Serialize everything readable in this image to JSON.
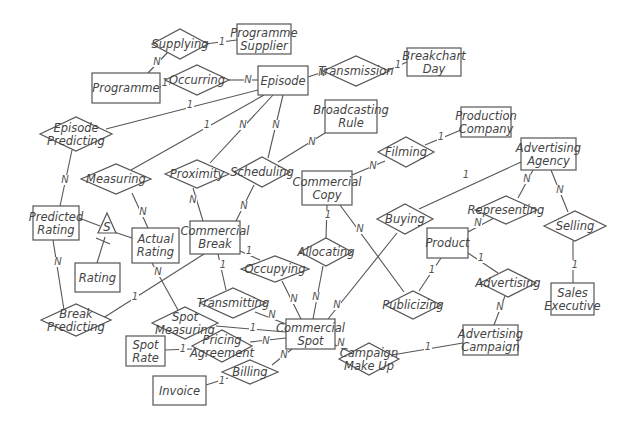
{
  "diagram": {
    "type": "entity-relationship",
    "entities": [
      {
        "id": "programme",
        "label": [
          "Programme"
        ],
        "x": 92,
        "y": 73,
        "w": 68,
        "h": 30
      },
      {
        "id": "programme_supplier",
        "label": [
          "Programme",
          "Supplier"
        ],
        "x": 237,
        "y": 24,
        "w": 54,
        "h": 30
      },
      {
        "id": "episode",
        "label": [
          "Episode"
        ],
        "x": 258,
        "y": 66,
        "w": 50,
        "h": 29
      },
      {
        "id": "breakchart_day",
        "label": [
          "Breakchart",
          "Day"
        ],
        "x": 407,
        "y": 48,
        "w": 54,
        "h": 28
      },
      {
        "id": "broadcasting_rule",
        "label": [
          "Broadcasting",
          "Rule"
        ],
        "x": 325,
        "y": 100,
        "w": 52,
        "h": 33
      },
      {
        "id": "production_company",
        "label": [
          "Production",
          "Company"
        ],
        "x": 461,
        "y": 107,
        "w": 50,
        "h": 30
      },
      {
        "id": "advertising_agency",
        "label": [
          "Advertising",
          "Agency"
        ],
        "x": 521,
        "y": 138,
        "w": 55,
        "h": 32
      },
      {
        "id": "commercial_copy",
        "label": [
          "Commercial",
          "Copy"
        ],
        "x": 302,
        "y": 171,
        "w": 50,
        "h": 34
      },
      {
        "id": "predicted_rating",
        "label": [
          "Predicted",
          "Rating"
        ],
        "x": 33,
        "y": 206,
        "w": 46,
        "h": 34
      },
      {
        "id": "actual_rating",
        "label": [
          "Actual",
          "Rating"
        ],
        "x": 132,
        "y": 228,
        "w": 47,
        "h": 35
      },
      {
        "id": "rating",
        "label": [
          "Rating"
        ],
        "x": 75,
        "y": 263,
        "w": 45,
        "h": 29
      },
      {
        "id": "commercial_break",
        "label": [
          "Commercial",
          "Break"
        ],
        "x": 190,
        "y": 221,
        "w": 50,
        "h": 33
      },
      {
        "id": "product",
        "label": [
          "Product"
        ],
        "x": 427,
        "y": 228,
        "w": 41,
        "h": 30
      },
      {
        "id": "sales_executive",
        "label": [
          "Sales",
          "Executive"
        ],
        "x": 551,
        "y": 283,
        "w": 43,
        "h": 32
      },
      {
        "id": "commercial_spot",
        "label": [
          "Commercial",
          "Spot"
        ],
        "x": 286,
        "y": 319,
        "w": 49,
        "h": 30
      },
      {
        "id": "advertising_campaign",
        "label": [
          "Advertising",
          "Campaign"
        ],
        "x": 463,
        "y": 325,
        "w": 55,
        "h": 30
      },
      {
        "id": "spot_rate",
        "label": [
          "Spot",
          "Rate"
        ],
        "x": 126,
        "y": 336,
        "w": 39,
        "h": 30
      },
      {
        "id": "invoice",
        "label": [
          "Invoice"
        ],
        "x": 153,
        "y": 376,
        "w": 53,
        "h": 29
      }
    ],
    "relationships": [
      {
        "id": "supplying",
        "label": [
          "Supplying"
        ],
        "cx": 180,
        "cy": 44,
        "w": 56,
        "h": 30
      },
      {
        "id": "occurring",
        "label": [
          "Occurring"
        ],
        "cx": 197,
        "cy": 80,
        "w": 64,
        "h": 30
      },
      {
        "id": "transmission",
        "label": [
          "Transmission"
        ],
        "cx": 356,
        "cy": 71,
        "w": 66,
        "h": 30
      },
      {
        "id": "episode_predicting",
        "label": [
          "Episode",
          "Predicting"
        ],
        "cx": 76,
        "cy": 134,
        "w": 72,
        "h": 34
      },
      {
        "id": "measuring",
        "label": [
          "Measuring"
        ],
        "cx": 116,
        "cy": 179,
        "w": 70,
        "h": 30
      },
      {
        "id": "proximity",
        "label": [
          "Proximity"
        ],
        "cx": 197,
        "cy": 174,
        "w": 64,
        "h": 28
      },
      {
        "id": "scheduling",
        "label": [
          "Scheduling"
        ],
        "cx": 262,
        "cy": 172,
        "w": 56,
        "h": 30
      },
      {
        "id": "filming",
        "label": [
          "Filming"
        ],
        "cx": 406,
        "cy": 152,
        "w": 56,
        "h": 30
      },
      {
        "id": "buying",
        "label": [
          "Buying"
        ],
        "cx": 405,
        "cy": 219,
        "w": 56,
        "h": 30
      },
      {
        "id": "representing",
        "label": [
          "Representing"
        ],
        "cx": 506,
        "cy": 210,
        "w": 62,
        "h": 28
      },
      {
        "id": "selling",
        "label": [
          "Selling"
        ],
        "cx": 575,
        "cy": 226,
        "w": 62,
        "h": 30
      },
      {
        "id": "allocating",
        "label": [
          "Allocating"
        ],
        "cx": 326,
        "cy": 252,
        "w": 52,
        "h": 28
      },
      {
        "id": "occupying",
        "label": [
          "Occupying"
        ],
        "cx": 275,
        "cy": 269,
        "w": 68,
        "h": 26
      },
      {
        "id": "transmitting",
        "label": [
          "Transmitting"
        ],
        "cx": 233,
        "cy": 303,
        "w": 66,
        "h": 30
      },
      {
        "id": "advertising",
        "label": [
          "Advertising"
        ],
        "cx": 508,
        "cy": 283,
        "w": 56,
        "h": 28
      },
      {
        "id": "publicizing",
        "label": [
          "Publicizing"
        ],
        "cx": 413,
        "cy": 305,
        "w": 56,
        "h": 28
      },
      {
        "id": "break_predicting",
        "label": [
          "Break",
          "Predicting"
        ],
        "cx": 76,
        "cy": 320,
        "w": 70,
        "h": 32
      },
      {
        "id": "spot_measuring",
        "label": [
          "Spot",
          "Measuring"
        ],
        "cx": 185,
        "cy": 323,
        "w": 66,
        "h": 32
      },
      {
        "id": "pricing_agreement",
        "label": [
          "Pricing",
          "Agreement"
        ],
        "cx": 222,
        "cy": 346,
        "w": 60,
        "h": 32
      },
      {
        "id": "billing",
        "label": [
          "Billing"
        ],
        "cx": 250,
        "cy": 372,
        "w": 56,
        "h": 24
      },
      {
        "id": "campaign_make_up",
        "label": [
          "Campaign",
          "Make Up"
        ],
        "cx": 369,
        "cy": 359,
        "w": 60,
        "h": 32
      }
    ],
    "subtype": {
      "symbol": "S",
      "cx": 107,
      "cy": 225
    },
    "edges": [
      {
        "from": "programme",
        "to": "supplying",
        "card": "N",
        "ax": 148,
        "ay": 73,
        "bx": 168,
        "by": 52,
        "cx": 157,
        "cy": 65
      },
      {
        "from": "supplying",
        "to": "programme_supplier",
        "card": "1",
        "ax": 205,
        "ay": 44,
        "bx": 237,
        "by": 40,
        "cx": 222,
        "cy": 45
      },
      {
        "from": "programme",
        "to": "occurring",
        "card": "1",
        "ax": 160,
        "ay": 87,
        "bx": 170,
        "by": 84,
        "cx": 165,
        "cy": 86
      },
      {
        "from": "occurring",
        "to": "episode",
        "card": "N",
        "ax": 229,
        "ay": 80,
        "bx": 258,
        "by": 80,
        "cx": 248,
        "cy": 83
      },
      {
        "from": "episode",
        "to": "transmission",
        "card": "N",
        "ax": 308,
        "ay": 77,
        "bx": 323,
        "by": 72,
        "cx": 322,
        "cy": 76
      },
      {
        "from": "transmission",
        "to": "breakchart_day",
        "card": "1",
        "ax": 389,
        "ay": 70,
        "bx": 407,
        "by": 62,
        "cx": 398,
        "cy": 68
      },
      {
        "from": "episode",
        "to": "episode_predicting",
        "card": "1",
        "ax": 258,
        "ay": 90,
        "bx": 106,
        "by": 129,
        "cx": 190,
        "cy": 108
      },
      {
        "from": "episode",
        "to": "measuring",
        "card": "1",
        "ax": 264,
        "ay": 95,
        "bx": 131,
        "by": 170,
        "cx": 207,
        "cy": 128
      },
      {
        "from": "episode",
        "to": "proximity",
        "card": "N",
        "ax": 273,
        "ay": 95,
        "bx": 210,
        "by": 163,
        "cx": 243,
        "cy": 128
      },
      {
        "from": "episode",
        "to": "scheduling",
        "card": "N",
        "ax": 283,
        "ay": 95,
        "bx": 268,
        "by": 158,
        "cx": 276,
        "cy": 128
      },
      {
        "from": "scheduling",
        "to": "broadcasting_rule",
        "card": "N",
        "ax": 278,
        "ay": 162,
        "bx": 325,
        "by": 133,
        "cx": 312,
        "cy": 145
      },
      {
        "from": "scheduling",
        "to": "commercial_break",
        "card": "N",
        "ax": 254,
        "ay": 185,
        "bx": 236,
        "by": 221,
        "cx": 244,
        "cy": 209
      },
      {
        "from": "proximity",
        "to": "commercial_break",
        "card": "N",
        "ax": 193,
        "ay": 188,
        "bx": 203,
        "by": 221,
        "cx": 193,
        "cy": 203
      },
      {
        "from": "episode_predicting",
        "to": "predicted_rating",
        "card": "N",
        "ax": 72,
        "ay": 150,
        "bx": 60,
        "by": 206,
        "cx": 65,
        "cy": 183
      },
      {
        "from": "measuring",
        "to": "actual_rating",
        "card": "N",
        "ax": 132,
        "ay": 193,
        "bx": 148,
        "by": 228,
        "cx": 143,
        "cy": 215
      },
      {
        "from": "predicted_rating",
        "to": "subtype",
        "card": "",
        "ax": 79,
        "ay": 218,
        "bx": 100,
        "by": 226,
        "cx": 0,
        "cy": 0
      },
      {
        "from": "subtype",
        "to": "actual_rating",
        "card": "",
        "ax": 114,
        "ay": 232,
        "bx": 132,
        "by": 238,
        "cx": 0,
        "cy": 0
      },
      {
        "from": "subtype",
        "to": "rating",
        "card": "",
        "ax": 105,
        "ay": 237,
        "bx": 97,
        "by": 263,
        "cx": 0,
        "cy": 0
      },
      {
        "from": "predicted_rating",
        "to": "break_predicting",
        "card": "N",
        "ax": 53,
        "ay": 240,
        "bx": 64,
        "by": 310,
        "cx": 58,
        "cy": 265
      },
      {
        "from": "commercial_break",
        "to": "break_predicting",
        "card": "1",
        "ax": 204,
        "ay": 254,
        "bx": 100,
        "by": 320,
        "cx": 135,
        "cy": 300
      },
      {
        "from": "actual_rating",
        "to": "spot_measuring",
        "card": "N",
        "ax": 152,
        "ay": 263,
        "bx": 178,
        "by": 310,
        "cx": 158,
        "cy": 275
      },
      {
        "from": "commercial_break",
        "to": "transmitting",
        "card": "1",
        "ax": 218,
        "ay": 254,
        "bx": 226,
        "by": 290,
        "cx": 223,
        "cy": 268
      },
      {
        "from": "commercial_break",
        "to": "occupying",
        "card": "1",
        "ax": 240,
        "ay": 251,
        "bx": 260,
        "by": 260,
        "cx": 249,
        "cy": 254
      },
      {
        "from": "occupying",
        "to": "commercial_spot",
        "card": "N",
        "ax": 282,
        "ay": 281,
        "bx": 301,
        "by": 319,
        "cx": 294,
        "cy": 302
      },
      {
        "from": "commercial_copy",
        "to": "allocating",
        "card": "1",
        "ax": 327,
        "ay": 205,
        "bx": 326,
        "by": 238,
        "cx": 328,
        "cy": 218
      },
      {
        "from": "allocating",
        "to": "commercial_spot",
        "card": "N",
        "ax": 323,
        "ay": 266,
        "bx": 313,
        "by": 319,
        "cx": 316,
        "cy": 300
      },
      {
        "from": "transmitting",
        "to": "commercial_spot",
        "card": "N",
        "ax": 255,
        "ay": 312,
        "bx": 286,
        "by": 324,
        "cx": 272,
        "cy": 318
      },
      {
        "from": "spot_measuring",
        "to": "commercial_spot",
        "card": "1",
        "ax": 216,
        "ay": 326,
        "bx": 286,
        "by": 332,
        "cx": 253,
        "cy": 331
      },
      {
        "from": "spot_rate",
        "to": "pricing_agreement",
        "card": "1",
        "ax": 165,
        "ay": 350,
        "bx": 192,
        "by": 349,
        "cx": 183,
        "cy": 352
      },
      {
        "from": "pricing_agreement",
        "to": "commercial_spot",
        "card": "N",
        "ax": 250,
        "ay": 342,
        "bx": 286,
        "by": 338,
        "cx": 266,
        "cy": 344
      },
      {
        "from": "invoice",
        "to": "billing",
        "card": "1",
        "ax": 206,
        "ay": 385,
        "bx": 228,
        "by": 378,
        "cx": 222,
        "cy": 384
      },
      {
        "from": "billing",
        "to": "commercial_spot",
        "card": "N",
        "ax": 272,
        "ay": 365,
        "bx": 292,
        "by": 349,
        "cx": 284,
        "cy": 358
      },
      {
        "from": "commercial_copy",
        "to": "filming",
        "card": "N",
        "ax": 352,
        "ay": 175,
        "bx": 385,
        "by": 161,
        "cx": 373,
        "cy": 169
      },
      {
        "from": "filming",
        "to": "production_company",
        "card": "1",
        "ax": 425,
        "ay": 145,
        "bx": 461,
        "by": 130,
        "cx": 441,
        "cy": 140
      },
      {
        "from": "commercial_copy",
        "to": "publicizing",
        "card": "N",
        "ax": 340,
        "ay": 205,
        "bx": 404,
        "by": 292,
        "cx": 360,
        "cy": 232
      },
      {
        "from": "product",
        "to": "publicizing",
        "card": "1",
        "ax": 441,
        "ay": 258,
        "bx": 419,
        "by": 291,
        "cx": 432,
        "cy": 273
      },
      {
        "from": "advertising_agency",
        "to": "buying",
        "card": "1",
        "ax": 521,
        "ay": 162,
        "bx": 419,
        "by": 209,
        "cx": 466,
        "cy": 178
      },
      {
        "from": "buying",
        "to": "commercial_spot",
        "card": "N",
        "ax": 397,
        "ay": 233,
        "bx": 328,
        "by": 319,
        "cx": 337,
        "cy": 308
      },
      {
        "from": "advertising_agency",
        "to": "representing",
        "card": "N",
        "ax": 533,
        "ay": 170,
        "bx": 518,
        "by": 198,
        "cx": 527,
        "cy": 182
      },
      {
        "from": "representing",
        "to": "product",
        "card": "N",
        "ax": 494,
        "ay": 218,
        "bx": 468,
        "by": 232,
        "cx": 478,
        "cy": 226
      },
      {
        "from": "advertising_agency",
        "to": "selling",
        "card": "N",
        "ax": 551,
        "ay": 170,
        "bx": 568,
        "by": 212,
        "cx": 560,
        "cy": 193
      },
      {
        "from": "selling",
        "to": "sales_executive",
        "card": "1",
        "ax": 573,
        "ay": 241,
        "bx": 573,
        "by": 283,
        "cx": 575,
        "cy": 268
      },
      {
        "from": "product",
        "to": "advertising",
        "card": "1",
        "ax": 468,
        "ay": 253,
        "bx": 498,
        "by": 273,
        "cx": 481,
        "cy": 261
      },
      {
        "from": "advertising",
        "to": "advertising_campaign",
        "card": "N",
        "ax": 505,
        "ay": 296,
        "bx": 494,
        "by": 325,
        "cx": 500,
        "cy": 310
      },
      {
        "from": "commercial_spot",
        "to": "campaign_make_up",
        "card": "N",
        "ax": 335,
        "ay": 345,
        "bx": 350,
        "by": 352,
        "cx": 341,
        "cy": 346
      },
      {
        "from": "campaign_make_up",
        "to": "advertising_campaign",
        "card": "1",
        "ax": 392,
        "ay": 355,
        "bx": 463,
        "by": 343,
        "cx": 428,
        "cy": 350
      }
    ]
  }
}
